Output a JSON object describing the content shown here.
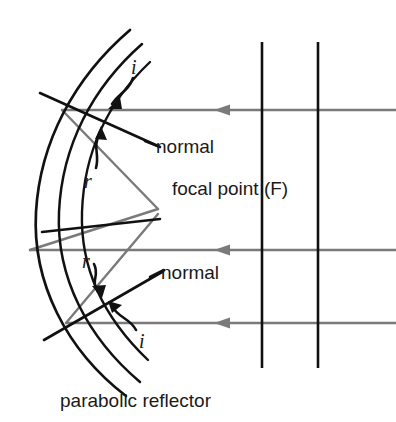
{
  "figure": {
    "caption": "parabolic reflector",
    "colors": {
      "ray": "#7a7a7a",
      "mirror": "#111111",
      "normal": "#111111",
      "wavefront": "#111111",
      "text": "#1a1a1a",
      "background": "#ffffff"
    },
    "labels": {
      "normal_top": "normal",
      "normal_bottom": "normal",
      "focal_point": "focal point (F)",
      "angle_i_top": "i",
      "angle_r_top": "r",
      "angle_r_bottom": "r",
      "angle_i_bottom": "i"
    },
    "geometry": {
      "focal_point": {
        "x": 155,
        "y": 208
      },
      "incident_rays": [
        {
          "y": 110,
          "x_start": 396,
          "x_end": 62,
          "arrow_x": 222
        },
        {
          "y": 250,
          "x_start": 396,
          "x_end": 30,
          "arrow_x": 222
        },
        {
          "y": 323,
          "x_start": 396,
          "x_end": 66,
          "arrow_x": 222
        }
      ],
      "wavefronts": [
        {
          "x": 262,
          "y_top": 42,
          "y_bottom": 368
        },
        {
          "x": 318,
          "y_top": 42,
          "y_bottom": 368
        }
      ],
      "mirror_arcs": 3
    }
  }
}
